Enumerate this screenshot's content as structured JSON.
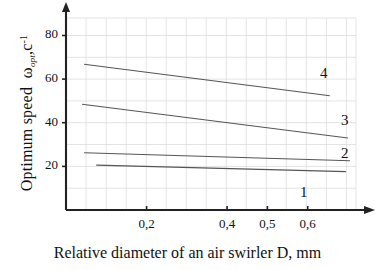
{
  "chart_data": {
    "type": "scatter",
    "title": "",
    "xlabel": "Relative diameter of an air swirler D, mm",
    "ylabel_text": "Optimum speed",
    "ylabel_symbol": "ω",
    "ylabel_subscript": "opt",
    "ylabel_units": "c",
    "ylabel_exponent": "-1",
    "xlim": [
      0.0,
      0.72
    ],
    "ylim": [
      0,
      88
    ],
    "grid": true,
    "legend_position": "inline-right",
    "xticks": [
      0.2,
      0.4,
      0.5,
      0.6
    ],
    "xticklabels": [
      "0,2",
      "0,4",
      "0,5",
      "0,6"
    ],
    "yticks": [
      20,
      40,
      60,
      80
    ],
    "yticklabels": [
      "20",
      "40",
      "60",
      "80"
    ],
    "marker": "triangle",
    "marker_color": "#1a1a1a",
    "line_color": "#555555",
    "grid_color": "#d8d8d8",
    "axis_color": "#222222",
    "series": [
      {
        "name": "1",
        "label": "1",
        "fit_x": [
          0.075,
          0.695
        ],
        "fit_y": [
          20.6,
          17.6
        ],
        "x": [
          0.105,
          0.215,
          0.235,
          0.305,
          0.325,
          0.425,
          0.525,
          0.695
        ],
        "y": [
          19.6,
          19.3,
          19.0,
          18.9,
          19.4,
          18.6,
          18.3,
          17.6
        ]
      },
      {
        "name": "2",
        "label": "2",
        "fit_x": [
          0.045,
          0.705
        ],
        "fit_y": [
          26.2,
          22.6
        ],
        "x": [
          0.055,
          0.095,
          0.185,
          0.215,
          0.255,
          0.335,
          0.395,
          0.445,
          0.525,
          0.615
        ],
        "y": [
          26.2,
          27.2,
          24.6,
          25.1,
          25.9,
          24.5,
          24.0,
          23.6,
          23.4,
          23.5
        ]
      },
      {
        "name": "3",
        "label": "3",
        "fit_x": [
          0.04,
          0.7
        ],
        "fit_y": [
          48.5,
          33.0
        ],
        "x": [
          0.055,
          0.085,
          0.145,
          0.215,
          0.235,
          0.325,
          0.355,
          0.405,
          0.495,
          0.595,
          0.625
        ],
        "y": [
          48.3,
          48.5,
          45.3,
          45.5,
          44.5,
          41.0,
          41.8,
          40.0,
          38.0,
          33.3,
          33.4
        ]
      },
      {
        "name": "4",
        "label": "4",
        "fit_x": [
          0.045,
          0.655
        ],
        "fit_y": [
          66.8,
          52.4
        ],
        "x": [
          0.055,
          0.085,
          0.145,
          0.225,
          0.235,
          0.315,
          0.445,
          0.475,
          0.535,
          0.595
        ],
        "y": [
          66.3,
          63.8,
          65.2,
          65.0,
          62.5,
          61.0,
          55.6,
          55.6,
          55.4,
          54.4
        ]
      }
    ]
  }
}
